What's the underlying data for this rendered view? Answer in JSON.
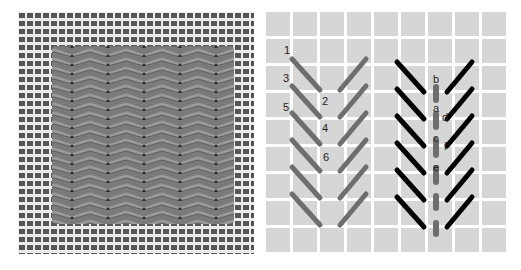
{
  "figure": {
    "left_panel": {
      "kind": "photo",
      "description": "Stitched canvas sample showing vertical rows of slanted herringbone-like stitches on mesh canvas",
      "colors": {
        "canvas": "#5a5a5a",
        "mesh_gap": "#e8e8e8",
        "stitch_fill": "#7b7b7b",
        "stitch_dark": "#3c3c3c"
      }
    },
    "right_panel": {
      "kind": "stitch-diagram",
      "colors": {
        "grid_cell": "#d6d6d6",
        "grid_line": "#ffffff",
        "first_pass": "#6e6e6e",
        "second_pass": "#000000",
        "center_stitch": "#6e6e6e"
      },
      "left_group_labels": [
        "1",
        "2",
        "3",
        "4",
        "5",
        "6"
      ],
      "right_group_labels": [
        "b",
        "a",
        "d",
        "c",
        "f",
        "e"
      ]
    }
  }
}
